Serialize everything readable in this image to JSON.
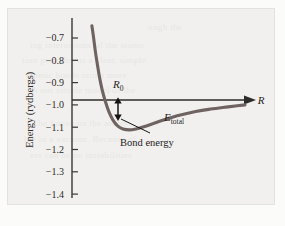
{
  "figure": {
    "background_color": "#f1f0ee",
    "page_color": "#fbfbfa",
    "frame_color": "#e3e2e0"
  },
  "chart_data": {
    "type": "line",
    "title": "",
    "subtitle": "",
    "xlabel": "R",
    "ylabel": "Energy (rydbergs)",
    "ylim": [
      -1.45,
      -0.62
    ],
    "xlim": [
      0,
      1
    ],
    "grid": false,
    "legend": "none",
    "y_ticks": [
      "-0.7",
      "-0.8",
      "-0.9",
      "-1.0",
      "-1.1",
      "-1.2",
      "-1.3",
      "-1.4"
    ],
    "y_tick_values": [
      -0.7,
      -0.8,
      -0.9,
      -1.0,
      -1.1,
      -1.2,
      -1.3,
      -1.4
    ],
    "x_ticks": [],
    "series": [
      {
        "name": "E_total",
        "color": "#6f6361",
        "comment": "Morse-like molecular potential energy curve",
        "x": [
          0.115,
          0.125,
          0.135,
          0.147,
          0.16,
          0.175,
          0.193,
          0.213,
          0.237,
          0.265,
          0.295,
          0.33,
          0.37,
          0.415,
          0.465,
          0.52,
          0.58,
          0.645,
          0.715,
          0.79,
          0.87,
          0.955,
          1.0
        ],
        "y": [
          -0.645,
          -0.7,
          -0.76,
          -0.82,
          -0.88,
          -0.935,
          -0.985,
          -1.03,
          -1.068,
          -1.095,
          -1.108,
          -1.112,
          -1.108,
          -1.098,
          -1.085,
          -1.07,
          -1.055,
          -1.042,
          -1.03,
          -1.02,
          -1.012,
          -1.004,
          -1.0
        ]
      }
    ],
    "reference_line": {
      "name": "dissociation-asymptote",
      "y": -1.0,
      "color": "#2e2b29",
      "arrow_end": true,
      "label": "R"
    },
    "annotations": [
      {
        "name": "equilibrium-separation",
        "label": "R",
        "subscript": "0",
        "x": 0.33,
        "y": -0.955
      },
      {
        "name": "bond-energy-arrow",
        "label": "Bond energy",
        "from_y": -1.0,
        "to_y": -1.112,
        "at_x": 0.33,
        "value": 0.112,
        "units": "rydbergs"
      },
      {
        "name": "total-energy-curve-label",
        "label": "E",
        "subscript": "total",
        "x": 0.64,
        "y": -1.075
      }
    ]
  },
  "bleed_text": [
    {
      "text": "ough the",
      "x": 148,
      "y": 22
    },
    {
      "text": "ing interactions of the atoms",
      "x": 30,
      "y": 40
    },
    {
      "text": "tion provides us a clear, simple",
      "x": 22,
      "y": 55
    },
    {
      "text": "atomic bonds into a more",
      "x": 26,
      "y": 70
    },
    {
      "text": "th our simple model of the",
      "x": 30,
      "y": 85
    },
    {
      "text": "he forces on the atoms",
      "x": 38,
      "y": 118
    },
    {
      "text": "ble in a vacuum. Because of",
      "x": 24,
      "y": 134
    },
    {
      "text": "ere can be no instabilities",
      "x": 30,
      "y": 150
    }
  ]
}
